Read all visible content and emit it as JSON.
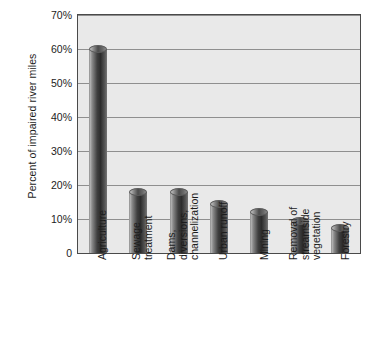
{
  "chart_data": {
    "type": "bar",
    "title": "",
    "xlabel": "",
    "ylabel": "Percent of impaired river miles",
    "ylim": [
      0,
      70
    ],
    "grid": true,
    "legend": "none",
    "orientation": "vertical",
    "bar_style": "3d-cylinder",
    "categories": [
      "Agriculture",
      "Sewage treatment",
      "Dams, diversions, channelization",
      "Urban runoff",
      "Mining",
      "Removal of streamside vegetation",
      "Forestry"
    ],
    "category_lines": [
      [
        "Agriculture"
      ],
      [
        "Sewage",
        "treatment"
      ],
      [
        "Dams,",
        "diversions,",
        "channelization"
      ],
      [
        "Urban runoff"
      ],
      [
        "Mining"
      ],
      [
        "Removal of",
        "streamside",
        "vegetation"
      ],
      [
        "Forestry"
      ]
    ],
    "values": [
      60,
      18,
      18,
      14.5,
      12,
      9.5,
      7.5
    ],
    "y_ticks": [
      0,
      10,
      20,
      30,
      40,
      50,
      60,
      70
    ],
    "y_tick_labels": [
      "0",
      "10%",
      "20%",
      "30%",
      "40%",
      "50%",
      "60%",
      "70%"
    ]
  },
  "colors": {
    "plot_background": "#e9e9e9",
    "gridline": "#8f8f8f",
    "axis_border": "#4a4a4a",
    "bar_dark": "#2c2c2c",
    "bar_light": "#b9b9b9",
    "text": "#1c1c1c",
    "page_background": "#ffffff"
  }
}
